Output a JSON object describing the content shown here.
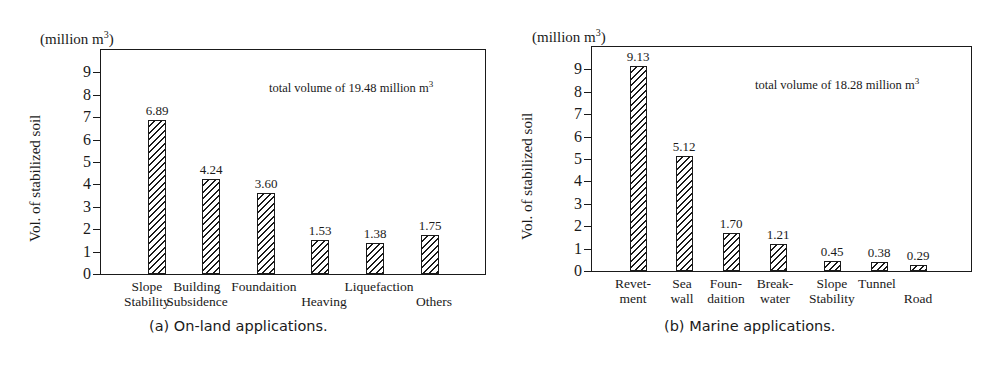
{
  "chart_data": [
    {
      "type": "bar",
      "title": "(a) On-land applications.",
      "caption": "(a) On-land applications.",
      "unit_label": "(million m",
      "unit_sup": "3",
      "unit_close": ")",
      "ylabel": "Vol. of stabilized soil",
      "xlabel": "",
      "ylim": [
        0,
        10
      ],
      "yticks": [
        "0",
        "1",
        "2",
        "3",
        "4",
        "5",
        "6",
        "7",
        "8",
        "9"
      ],
      "grid": false,
      "annotation": "total volume of 19.48 million m",
      "annotation_sup": "3",
      "categories": [
        "Slope\nStability",
        "Building\nSubsidence",
        "Foundaition",
        "Heaving",
        "Liquefaction",
        "Others"
      ],
      "category_labels": [
        {
          "text": "Slope\nStability",
          "row": "both"
        },
        {
          "text": "Building\nSubsidence",
          "row": "both"
        },
        {
          "text": "Foundaition",
          "row": "top"
        },
        {
          "text": "Heaving",
          "row": "bottom"
        },
        {
          "text": "Liquefaction",
          "row": "top"
        },
        {
          "text": "Others",
          "row": "bottom"
        }
      ],
      "values": [
        6.89,
        4.24,
        3.6,
        1.53,
        1.38,
        1.75
      ],
      "value_labels": [
        "6.89",
        "4.24",
        "3.60",
        "1.53",
        "1.38",
        "1.75"
      ]
    },
    {
      "type": "bar",
      "title": "(b) Marine applications.",
      "caption": "(b) Marine applications.",
      "unit_label": "(million m",
      "unit_sup": "3",
      "unit_close": ")",
      "ylabel": "Vol. of stabilized soil",
      "xlabel": "",
      "ylim": [
        0,
        10
      ],
      "yticks": [
        "0",
        "1",
        "2",
        "3",
        "4",
        "5",
        "6",
        "7",
        "8",
        "9"
      ],
      "grid": false,
      "annotation": "total volume of 18.28 million m",
      "annotation_sup": "3",
      "categories": [
        "Revet-\nment",
        "Sea\nwall",
        "Foun-\ndaition",
        "Break-\nwater",
        "Slope\nStability",
        "Tunnel",
        "Road"
      ],
      "category_labels": [
        {
          "text": "Revet-\nment",
          "row": "both"
        },
        {
          "text": "Sea\nwall",
          "row": "both"
        },
        {
          "text": "Foun-\ndaition",
          "row": "both"
        },
        {
          "text": "Break-\nwater",
          "row": "both"
        },
        {
          "text": "Slope\nStability",
          "row": "both"
        },
        {
          "text": "Tunnel",
          "row": "top"
        },
        {
          "text": "Road",
          "row": "bottom"
        }
      ],
      "values": [
        9.13,
        5.12,
        1.7,
        1.21,
        0.45,
        0.38,
        0.29
      ],
      "value_labels": [
        "9.13",
        "5.12",
        "1.70",
        "1.21",
        "0.45",
        "0.38",
        "0.29"
      ]
    }
  ]
}
